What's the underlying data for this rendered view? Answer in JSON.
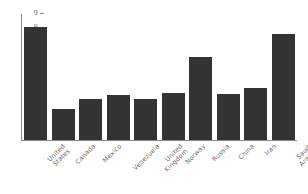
{
  "chart_data": {
    "type": "bar",
    "title": "",
    "subtitle": "",
    "xlabel": "",
    "ylabel": "",
    "ylim": [
      0,
      9
    ],
    "grid": false,
    "legend": null,
    "bar_color": "#333333",
    "axis_color": "#8a8a8a",
    "tick_label_color": "#888888",
    "background": "#ffffff",
    "categories": [
      "United States",
      "Canada",
      "Mexico",
      "Venezuela",
      "United Kingdom",
      "Norway",
      "Russia",
      "China",
      "Iran",
      "Saudi Arabia"
    ],
    "values": [
      8.1,
      2.25,
      2.9,
      3.2,
      2.9,
      3.35,
      5.9,
      3.3,
      3.75,
      7.6
    ],
    "ytick_labels": [
      "0",
      "1",
      "2",
      "3",
      "4",
      "5",
      "6",
      "7",
      "8",
      "9"
    ],
    "ytick_values": [
      0,
      1,
      2,
      3,
      4,
      5,
      6,
      7,
      8,
      9
    ]
  }
}
